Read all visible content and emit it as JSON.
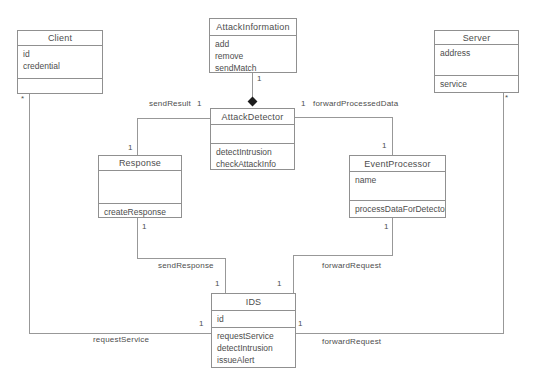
{
  "diagram": {
    "classes": [
      {
        "name": "Client",
        "attributes": [
          "id",
          "credential"
        ],
        "methods": []
      },
      {
        "name": "AttackInformation",
        "attributes": [],
        "methods": [
          "add",
          "remove",
          "sendMatch"
        ]
      },
      {
        "name": "Server",
        "attributes": [
          "address"
        ],
        "methods": [
          "service"
        ]
      },
      {
        "name": "AttackDetector",
        "attributes": [],
        "methods": [
          "detectIntrusion",
          "checkAttackInfo"
        ]
      },
      {
        "name": "Response",
        "attributes": [],
        "methods": [
          "createResponse"
        ]
      },
      {
        "name": "EventProcessor",
        "attributes": [
          "name"
        ],
        "methods": [
          "processDataForDetector"
        ]
      },
      {
        "name": "IDS",
        "attributes": [
          "id"
        ],
        "methods": [
          "requestService",
          "detectIntrusion",
          "issueAlert"
        ]
      }
    ],
    "associations": {
      "attack_info_composition": {
        "attack_detector_end": "1"
      },
      "send_result": {
        "label": "sendResult",
        "attack_detector_end": "1",
        "response_end": "1"
      },
      "forward_processed_data": {
        "label": "forwardProcessedData",
        "attack_detector_end": "1",
        "event_processor_end": "1"
      },
      "send_response": {
        "label": "sendResponse",
        "response_end": "1",
        "ids_end": "1"
      },
      "forward_request_from_processor": {
        "label": "forwardRequest",
        "event_processor_end": "1",
        "ids_end": "1"
      },
      "request_service": {
        "label": "requestService",
        "client_end": "*",
        "ids_end": "1"
      },
      "forward_request_to_server": {
        "label": "forwardRequest",
        "server_end": "*",
        "ids_end": "1"
      }
    },
    "colors": {
      "line": "#989898",
      "text": "#4d4d4d",
      "diamond": "#1c1c1c",
      "background": "#ffffff"
    }
  }
}
